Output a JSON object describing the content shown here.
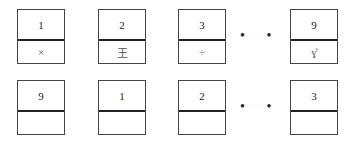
{
  "rows": [
    {
      "cells": [
        {
          "index": "1",
          "symbol": "×"
        },
        {
          "index": "2",
          "symbol": "王"
        },
        {
          "index": "3",
          "symbol": "÷"
        },
        {
          "index": "9",
          "symbol": "ɣ̊"
        }
      ],
      "ellipsis": "• • •"
    },
    {
      "cells": [
        {
          "index": "9",
          "symbol": ""
        },
        {
          "index": "1",
          "symbol": ""
        },
        {
          "index": "2",
          "symbol": ""
        },
        {
          "index": "3",
          "symbol": ""
        }
      ],
      "ellipsis": "• • •"
    }
  ]
}
